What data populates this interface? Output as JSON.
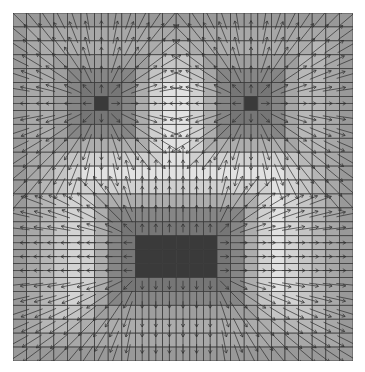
{
  "figure": {
    "type": "vector-field-over-distance-grid",
    "grid": {
      "cols": 25,
      "rows": 25,
      "cell_w": 13.6,
      "cell_h": 13.92,
      "line_color": "#3c3c3c"
    },
    "colors": {
      "feature": "#3a3a3a",
      "near": "#8a8a8a",
      "ring_bright": "#e2e2e2",
      "edge": "#7a7a7a",
      "arrow": "#2e2e2e"
    },
    "features": [
      {
        "name": "left-eye",
        "col0": 6,
        "row0": 6,
        "col1": 6,
        "row1": 6
      },
      {
        "name": "right-eye",
        "col0": 17,
        "row0": 6,
        "col1": 17,
        "row1": 6
      },
      {
        "name": "mouth",
        "col0": 9,
        "row0": 16,
        "col1": 14,
        "row1": 18
      }
    ]
  }
}
